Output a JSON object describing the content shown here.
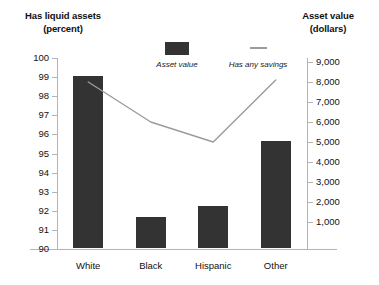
{
  "chart_data": {
    "type": "bar",
    "title": "",
    "categories": [
      "White",
      "Black",
      "Hispanic",
      "Other"
    ],
    "series": [
      {
        "name": "Asset value",
        "render": "bar",
        "axis": "left",
        "values": [
          99.0,
          91.6,
          92.2,
          95.6
        ]
      },
      {
        "name": "Has any savings",
        "render": "line",
        "axis": "right",
        "values": [
          8000,
          6000,
          5000,
          8100
        ]
      }
    ],
    "xlabel": "",
    "ylabel": "Has liquid assets (percent)",
    "y2label": "Asset value (dollars)",
    "ylim": [
      90,
      100
    ],
    "y2lim": [
      0,
      9000
    ],
    "yticks": [
      90,
      91,
      92,
      93,
      94,
      95,
      96,
      97,
      98,
      99,
      100
    ],
    "y2ticks": [
      1000,
      2000,
      3000,
      4000,
      5000,
      6000,
      7000,
      8000,
      9000
    ],
    "grid": false,
    "legend_position": "top-center",
    "colors": {
      "bar": "#333333",
      "line": "#9b9b9b",
      "axis": "#b4b4b4",
      "text": "#111111"
    }
  },
  "left_axis": {
    "title_line1": "Has liquid assets",
    "title_line2": "(percent)",
    "tick_labels": [
      "100",
      "99",
      "98",
      "97",
      "96",
      "95",
      "94",
      "93",
      "92",
      "91",
      "90"
    ]
  },
  "right_axis": {
    "title_line1": "Asset value",
    "title_line2": "(dollars)",
    "tick_labels": [
      "9,000",
      "8,000",
      "7,000",
      "6,000",
      "5,000",
      "4,000",
      "3,000",
      "2,000",
      "1,000"
    ]
  },
  "legend": {
    "items": [
      {
        "label": "Asset value",
        "marker": "filled-square"
      },
      {
        "label": "Has any savings",
        "marker": "horizontal-line"
      }
    ]
  },
  "categories": {
    "labels": [
      "White",
      "Black",
      "Hispanic",
      "Other"
    ]
  }
}
